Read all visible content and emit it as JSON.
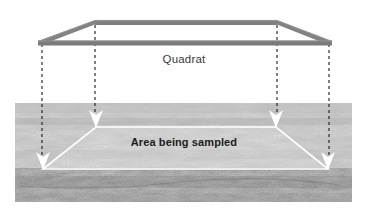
{
  "figure": {
    "kind": "quadrat-sampling-diagram",
    "background_color": "#ffffff",
    "width": 368,
    "height": 219
  },
  "labels": {
    "quadrat": "Quadrat",
    "area_being_sampled": "Area being sampled"
  },
  "quadrat_frame": {
    "name": "quadrat-frame",
    "description": "square sampling frame drawn in perspective as a trapezoid outline",
    "color": "#7f7f7f",
    "highlight_color": "#a0a0a0",
    "bar_thickness_px": 5,
    "corners": {
      "front_left": [
        40,
        43
      ],
      "front_right": [
        330,
        43
      ],
      "back_left": [
        95,
        22
      ],
      "back_right": [
        277,
        22
      ]
    }
  },
  "projection_lines": {
    "name": "projection-dashed-lines",
    "style": "dashed",
    "color": "#1a1a1a",
    "count": 4,
    "x_positions": [
      42,
      95,
      277,
      329
    ]
  },
  "photograph": {
    "name": "grass-photograph",
    "subject": "grass turf ground surface",
    "palette": "grayscale",
    "bounds": {
      "x": 15,
      "y": 103,
      "width": 337,
      "height": 99
    }
  },
  "sampled_area_overlay": {
    "name": "sampled-area-trapezoid",
    "outline_color": "#ffffff",
    "corners": {
      "front_left": [
        43,
        169
      ],
      "front_right": [
        328,
        169
      ],
      "back_left": [
        96,
        127
      ],
      "back_right": [
        276,
        127
      ]
    },
    "arrow_color": "#ffffff",
    "arrow_tip_positions": [
      [
        43,
        169
      ],
      [
        96,
        127
      ],
      [
        276,
        127
      ],
      [
        328,
        169
      ]
    ]
  }
}
